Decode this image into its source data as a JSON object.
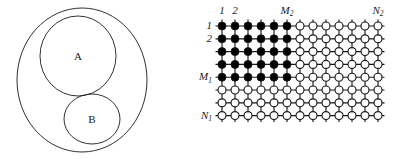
{
  "figure": {
    "title": "",
    "background_color": "#ffffff",
    "stroke_color": "#1a1a1a"
  },
  "set_diagram": {
    "name": "nested-set-diagram",
    "outer_region_label": "",
    "inner_regions": [
      {
        "label": "A",
        "position": "upper"
      },
      {
        "label": "B",
        "position": "lower-right"
      }
    ]
  },
  "chart_data": {
    "type": "heatmap",
    "title": "",
    "xlabel": "",
    "ylabel": "",
    "n_columns": 13,
    "n_rows": 8,
    "filled_columns": 6,
    "filled_rows": 5,
    "filled_color": "#000000",
    "open_color": "#ffffff",
    "column_labels": [
      {
        "text": "1",
        "column": 1
      },
      {
        "text": "2",
        "column": 2
      },
      {
        "text": "M",
        "sub": "2",
        "column": 6
      },
      {
        "text": "N",
        "sub": "2",
        "column": 13
      }
    ],
    "row_labels": [
      {
        "text": "1",
        "row": 1
      },
      {
        "text": "2",
        "row": 2
      },
      {
        "text": "M",
        "sub": "1",
        "row": 5
      },
      {
        "text": "N",
        "sub": "1",
        "row": 8
      }
    ],
    "cells": [
      [
        1,
        1,
        1,
        1,
        1,
        1,
        0,
        0,
        0,
        0,
        0,
        0,
        0
      ],
      [
        1,
        1,
        1,
        1,
        1,
        1,
        0,
        0,
        0,
        0,
        0,
        0,
        0
      ],
      [
        1,
        1,
        1,
        1,
        1,
        1,
        0,
        0,
        0,
        0,
        0,
        0,
        0
      ],
      [
        1,
        1,
        1,
        1,
        1,
        1,
        0,
        0,
        0,
        0,
        0,
        0,
        0
      ],
      [
        1,
        1,
        1,
        1,
        1,
        1,
        0,
        0,
        0,
        0,
        0,
        0,
        0
      ],
      [
        0,
        0,
        0,
        0,
        0,
        0,
        0,
        0,
        0,
        0,
        0,
        0,
        0
      ],
      [
        0,
        0,
        0,
        0,
        0,
        0,
        0,
        0,
        0,
        0,
        0,
        0,
        0
      ],
      [
        0,
        0,
        0,
        0,
        0,
        0,
        0,
        0,
        0,
        0,
        0,
        0,
        0
      ]
    ]
  }
}
